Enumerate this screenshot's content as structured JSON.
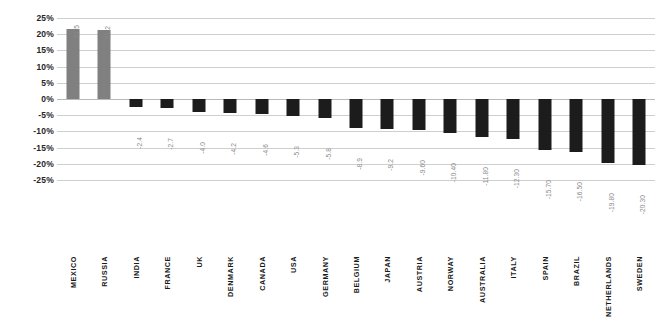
{
  "chart_data": {
    "type": "bar",
    "title": "",
    "subtitle": "",
    "xlabel": "",
    "ylabel": "",
    "grid": true,
    "legend": "none",
    "ylim": [
      -25,
      25
    ],
    "ytick_labels": [
      "25%",
      "20%",
      "15%",
      "10%",
      "5%",
      "0%",
      "-5%",
      "-10%",
      "-15%",
      "-20%",
      "-25%"
    ],
    "ytick_values": [
      25,
      20,
      15,
      10,
      5,
      0,
      -5,
      -10,
      -15,
      -20,
      -25
    ],
    "categories": [
      "MEXICO",
      "RUSSIA",
      "INDIA",
      "FRANCE",
      "UK",
      "DENMARK",
      "CANADA",
      "USA",
      "GERMANY",
      "BELGIUM",
      "JAPAN",
      "AUSTRIA",
      "NORWAY",
      "AUSTRALIA",
      "ITALY",
      "SPAIN",
      "BRAZIL",
      "NETHERLANDS",
      "SWEDEN"
    ],
    "values": [
      21.5,
      21.2,
      -2.4,
      -2.7,
      -4.0,
      -4.2,
      -4.6,
      -5.3,
      -5.8,
      -8.9,
      -9.2,
      -9.6,
      -10.4,
      -11.8,
      -12.3,
      -15.7,
      -16.5,
      -19.8,
      -20.3
    ],
    "value_labels": [
      "21.5",
      "21.2",
      "-2.4",
      "-2.7",
      "-4.0",
      "-4.2",
      "-4.6",
      "-5.3",
      "-5.8",
      "-8.9",
      "-9.2",
      "-9.60",
      "-10.40",
      "-11.80",
      "-12.30",
      "-15.70",
      "-16.50",
      "-19.80",
      "-20.30"
    ],
    "colors": {
      "positive_bar": "#808080",
      "negative_bar": "#1c1c1c",
      "gridline": "#cfcfcf",
      "zero_line": "#b8b8b8",
      "value_label": "#8a8a8a",
      "category_label": "#1a1a1a",
      "axis_label": "#262626",
      "background": "#ffffff"
    }
  }
}
